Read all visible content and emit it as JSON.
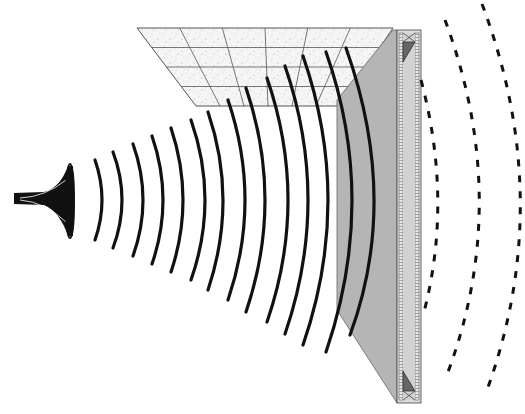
{
  "diagram": {
    "caption_text": "",
    "colors": {
      "background": "#ffffff",
      "wave_stroke": "#111111",
      "ceiling_fill": "#f4f4f4",
      "ceiling_grid": "#555555",
      "wall_face": "#b5b5b5",
      "wall_frame": "#d6d6d6",
      "frame_stroke": "#444444"
    },
    "components": [
      {
        "id": "horn",
        "label": "Sound source (horn)",
        "position": [
          14,
          200
        ]
      },
      {
        "id": "incident-waves",
        "label": "Incident sound waves",
        "count": 14,
        "style": "solid"
      },
      {
        "id": "ceiling",
        "label": "Acoustic ceiling tiles",
        "grid": {
          "columns": 6,
          "rows": 4
        }
      },
      {
        "id": "wall-panel",
        "label": "Absorptive wall panel",
        "style": "grey face with framed edge"
      },
      {
        "id": "transmitted-waves",
        "label": "Transmitted sound waves",
        "count": 3,
        "style": "dashed"
      }
    ],
    "incident_wave_x": [
      102,
      122,
      143,
      163,
      183,
      205,
      223,
      245,
      265,
      288,
      308,
      328,
      352,
      373
    ],
    "incident_wave_halfheight": [
      40,
      48,
      56,
      64,
      72,
      80,
      90,
      100,
      112,
      122,
      134,
      145,
      150,
      152
    ],
    "transmitted_waves": [
      {
        "top": [
          421,
          80
        ],
        "peak": [
          437,
          220
        ],
        "bottom": [
          424,
          312
        ]
      },
      {
        "top": [
          445,
          20
        ],
        "peak": [
          478,
          210
        ],
        "bottom": [
          448,
          372
        ]
      },
      {
        "top": [
          482,
          4
        ],
        "peak": [
          519,
          210
        ],
        "bottom": [
          487,
          390
        ]
      }
    ]
  }
}
